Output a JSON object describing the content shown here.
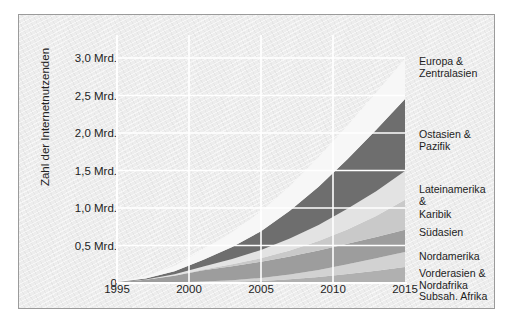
{
  "chart_data": {
    "type": "area",
    "stacked": true,
    "title": "",
    "xlabel": "",
    "ylabel": "Zahl der Internetnutzenden",
    "x": [
      1995,
      1997,
      1999,
      2001,
      2003,
      2005,
      2007,
      2009,
      2011,
      2013,
      2015
    ],
    "xlim": [
      1995,
      2015
    ],
    "ylim": [
      0,
      3.2
    ],
    "x_ticks": [
      "1995",
      "2000",
      "2005",
      "2010",
      "2015"
    ],
    "x_tick_values": [
      1995,
      2000,
      2005,
      2010,
      2015
    ],
    "y_ticks": [
      "0",
      "0,5 Mrd.",
      "1,0 Mrd.",
      "1,5 Mrd.",
      "2,0 Mrd.",
      "2,5 Mrd.",
      "3,0 Mrd."
    ],
    "y_tick_values": [
      0,
      0.5,
      1.0,
      1.5,
      2.0,
      2.5,
      3.0
    ],
    "grid": true,
    "legend_position": "right-inline",
    "units": "Milliarden",
    "series": [
      {
        "name": "Subsah. Afrika",
        "color": "#b0b0b0",
        "values": [
          0.0,
          0.001,
          0.003,
          0.008,
          0.016,
          0.028,
          0.05,
          0.08,
          0.12,
          0.165,
          0.215
        ]
      },
      {
        "name": "Vorderasien &\nNordafrika",
        "color": "#d2d2d2",
        "values": [
          0.0,
          0.001,
          0.004,
          0.011,
          0.022,
          0.04,
          0.065,
          0.095,
          0.13,
          0.165,
          0.2
        ]
      },
      {
        "name": "Nordamerika",
        "color": "#9d9d9d",
        "values": [
          0.01,
          0.04,
          0.09,
          0.15,
          0.185,
          0.215,
          0.24,
          0.26,
          0.275,
          0.285,
          0.295
        ]
      },
      {
        "name": "Südasien",
        "color": "#c9c9c9",
        "values": [
          0.0,
          0.001,
          0.004,
          0.012,
          0.026,
          0.048,
          0.08,
          0.125,
          0.19,
          0.28,
          0.4
        ]
      },
      {
        "name": "Lateinamerika &\nKaribik",
        "color": "#e3e3e3",
        "values": [
          0.001,
          0.004,
          0.015,
          0.04,
          0.07,
          0.11,
          0.16,
          0.215,
          0.275,
          0.33,
          0.385
        ]
      },
      {
        "name": "Ostasien &\nPazifik",
        "color": "#6e6e6e",
        "values": [
          0.002,
          0.012,
          0.04,
          0.09,
          0.16,
          0.25,
          0.37,
          0.51,
          0.66,
          0.82,
          0.96
        ]
      },
      {
        "name": "Europa &\nZentralasien",
        "color": "#f7f7f7",
        "values": [
          0.006,
          0.03,
          0.075,
          0.14,
          0.2,
          0.265,
          0.33,
          0.395,
          0.45,
          0.495,
          0.535
        ]
      }
    ],
    "legend_labels": [
      "Europa &\nZentralasien",
      "Ostasien &\nPazifik",
      "Lateinamerika &\nKaribik",
      "Südasien",
      "Nordamerika",
      "Vorderasien &\nNordafrika",
      "Subsah. Afrika"
    ]
  },
  "legend_positions": [
    40,
    113,
    168,
    211,
    235,
    252,
    275
  ]
}
